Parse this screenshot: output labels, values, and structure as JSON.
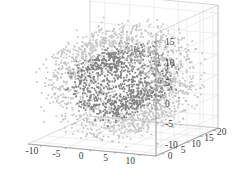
{
  "chart_data": {
    "type": "scatter",
    "projection": "3d",
    "title": "",
    "subtitle": "",
    "xlabel": "",
    "ylabel": "",
    "zlabel": "",
    "grid": true,
    "legend": null,
    "background_color": "#ffffff",
    "axes": {
      "x": {
        "ticks": [
          -10,
          -5,
          0,
          5,
          10
        ],
        "tick_labels": [
          "-10",
          "-5",
          "0",
          "5",
          "10"
        ],
        "lim": [
          -13,
          13
        ],
        "position": "bottom-left"
      },
      "y": {
        "ticks": [
          0,
          5,
          10,
          15,
          20
        ],
        "tick_labels": [
          "0",
          "5",
          "10",
          "15",
          "20"
        ],
        "lim": [
          -2,
          22
        ],
        "position": "bottom-right"
      },
      "z": {
        "ticks": [
          -10,
          -5,
          0,
          5,
          10,
          15
        ],
        "tick_labels": [
          "-10",
          "-5",
          "0",
          "5",
          "10",
          "15"
        ],
        "lim": [
          -13,
          17
        ],
        "position": "right"
      }
    },
    "series": [
      {
        "name": "inner-manifold",
        "color": "#808080",
        "marker": "square",
        "marker_size": 1.7,
        "n_points": 1100,
        "shape": "cylindrical-band",
        "radius": 6.0,
        "radius_jitter": 1.1,
        "extent_y": [
          1.0,
          19.0
        ],
        "center_z": 0.5
      },
      {
        "name": "outer-shell",
        "color": "#c4c4c4",
        "marker": "square",
        "marker_size": 1.7,
        "n_points": 1500,
        "shape": "cylindrical-shell",
        "radius": 10.5,
        "radius_jitter": 1.6,
        "extent_y": [
          0.0,
          20.0
        ],
        "center_z": 0.5
      }
    ]
  }
}
